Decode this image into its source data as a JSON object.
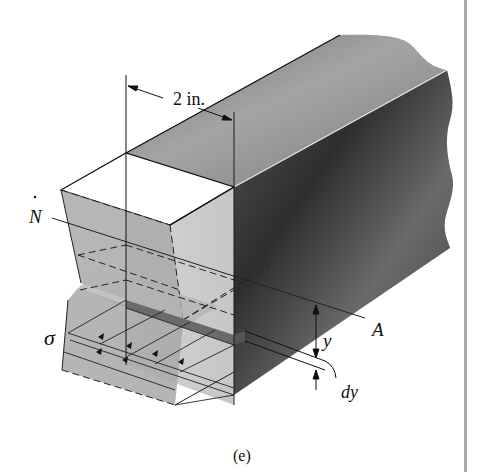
{
  "figure": {
    "caption": "(e)",
    "labels": {
      "dimension": "2 in.",
      "neutral_axis_left": "N",
      "neutral_axis_right": "A",
      "stress": "σ",
      "distance": "y",
      "strip_thickness": "dy"
    },
    "colors": {
      "beam_dark": "#3a3a3a",
      "beam_mid": "#8a8a8a",
      "beam_light": "#bdbdbd",
      "section_face": "#c9c9c9",
      "stress_block": "#a9a9a9",
      "strip": "#6a6a6a",
      "line": "#1a1a1a",
      "margin_bar": "#a8a8a8"
    }
  }
}
